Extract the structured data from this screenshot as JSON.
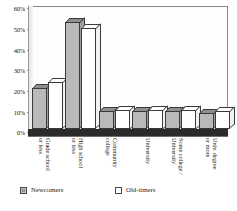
{
  "chart_data": {
    "type": "bar",
    "title": "",
    "xlabel": "",
    "ylabel": "",
    "ylim": [
      0,
      60
    ],
    "grid": false,
    "legend_position": "bottom",
    "categories": [
      "Grade school or less",
      "High school or less",
      "Community college",
      "University",
      "Some college / University",
      "Univ. degree or more"
    ],
    "category_lines": [
      [
        "Grade school",
        "or less"
      ],
      [
        "High school",
        "or less"
      ],
      [
        "Community",
        "college"
      ],
      [
        "University"
      ],
      [
        "Some college /",
        "University"
      ],
      [
        "Univ. degree",
        "or more"
      ]
    ],
    "ytick_labels": [
      "60%",
      "50%",
      "40%",
      "30%",
      "20%",
      "10%",
      "0%"
    ],
    "ytick_values": [
      60,
      50,
      40,
      30,
      20,
      10,
      0
    ],
    "series": [
      {
        "name": "Newcomers",
        "color": "#b9b9b9",
        "values": [
          21,
          55,
          9,
          9,
          9,
          8
        ]
      },
      {
        "name": "Old-timers",
        "color": "#ffffff",
        "values": [
          24,
          52,
          10,
          10,
          10,
          9
        ]
      }
    ]
  },
  "legend": {
    "items": [
      {
        "label": "Newcomers",
        "style": "filled"
      },
      {
        "label": "Old-timers",
        "style": "empty"
      }
    ]
  },
  "caption": {
    "text": " "
  }
}
